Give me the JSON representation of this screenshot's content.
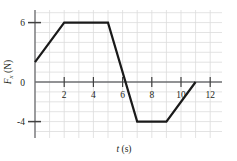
{
  "chart_data": {
    "type": "line",
    "title": "",
    "subtitle": "",
    "xlabel": "t (s)",
    "ylabel": "Fx (N)",
    "xlabel_symbol": "t",
    "xlabel_units": "(s)",
    "ylabel_symbol": "F",
    "ylabel_subscript": "x",
    "ylabel_units": "(N)",
    "x": [
      0,
      2,
      5,
      7,
      9,
      11
    ],
    "values": [
      2,
      6,
      6,
      -4,
      -4,
      0
    ],
    "series": [
      {
        "name": "Fx",
        "x": [
          0,
          2,
          5,
          7,
          9,
          11
        ],
        "values": [
          2,
          6,
          6,
          -4,
          -4,
          0
        ]
      }
    ],
    "xlim": [
      0,
      12
    ],
    "ylim": [
      -6,
      7
    ],
    "xticks": [
      2,
      4,
      6,
      8,
      10,
      12
    ],
    "xtick_labels": [
      "2",
      "4",
      "6",
      "8",
      "10",
      "12"
    ],
    "yticks": [
      6,
      0,
      -4
    ],
    "ytick_labels": [
      "6",
      "0",
      "-4"
    ],
    "grid": true,
    "grid_x_step": 1,
    "grid_y_step": 1,
    "legend": null,
    "legend_position": "none",
    "annotations": [],
    "colors": {
      "line": "#1a1a1a",
      "grid": "#d9d9d9",
      "axis": "#58595b",
      "text": "#231f20",
      "background": "#ffffff"
    }
  },
  "axes": {
    "y_tick_6": "6",
    "y_tick_0": "0",
    "y_tick_neg4": "-4",
    "x_tick_2": "2",
    "x_tick_4": "4",
    "x_tick_6": "6",
    "x_tick_8": "8",
    "x_tick_10": "10",
    "x_tick_12": "12",
    "x_axis_symbol": "t",
    "x_axis_units": "(s)",
    "y_axis_symbol": "F",
    "y_axis_subscript": "x",
    "y_axis_units": "(N)"
  }
}
